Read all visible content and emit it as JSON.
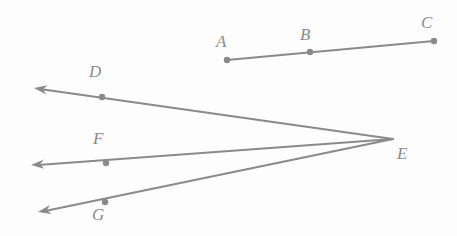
{
  "figure": {
    "background_color": "#fdfdfd",
    "stroke_color": "#8a8a8a",
    "label_color": "#8a8a8a",
    "stroke_width": 2.2,
    "dot_radius": 3.2,
    "width": 457,
    "height": 236
  },
  "points": {
    "A": {
      "label": "A",
      "x": 227,
      "y": 60,
      "label_x": 216,
      "label_y": 33,
      "has_dot": true
    },
    "B": {
      "label": "B",
      "x": 310,
      "y": 52,
      "label_x": 300,
      "label_y": 26,
      "has_dot": true
    },
    "C": {
      "label": "C",
      "x": 434,
      "y": 41,
      "label_x": 421,
      "label_y": 14,
      "has_dot": true
    },
    "D": {
      "label": "D",
      "x": 102,
      "y": 97,
      "label_x": 89,
      "label_y": 63,
      "has_dot": true
    },
    "E": {
      "label": "E",
      "x": 393,
      "y": 139,
      "label_x": 397,
      "label_y": 145,
      "has_dot": false
    },
    "F": {
      "label": "F",
      "x": 106,
      "y": 163,
      "label_x": 93,
      "label_y": 130,
      "has_dot": true
    },
    "G": {
      "label": "G",
      "x": 105,
      "y": 202,
      "label_x": 92,
      "label_y": 206,
      "has_dot": true
    }
  },
  "segments": [
    {
      "name": "segment-ac",
      "from": "A",
      "to": "C",
      "x1": 227,
      "y1": 60,
      "x2": 434,
      "y2": 41,
      "arrow_start": false,
      "arrow_end": false
    }
  ],
  "rays": [
    {
      "name": "ray-ed",
      "vertex": "E",
      "through": "D",
      "x1": 393,
      "y1": 139,
      "x2": 40,
      "y2": 89,
      "arrow_tip_x": 34,
      "arrow_tip_y": 88,
      "arrow_end": true
    },
    {
      "name": "ray-ef",
      "vertex": "E",
      "through": "F",
      "x1": 393,
      "y1": 139,
      "x2": 38,
      "y2": 165,
      "arrow_tip_x": 31,
      "arrow_tip_y": 165,
      "arrow_end": true
    },
    {
      "name": "ray-eg",
      "vertex": "E",
      "through": "G",
      "x1": 393,
      "y1": 139,
      "x2": 45,
      "y2": 211,
      "arrow_tip_x": 38,
      "arrow_tip_y": 212,
      "arrow_end": true
    }
  ],
  "arrow": {
    "length": 13,
    "half_width": 4.6
  }
}
